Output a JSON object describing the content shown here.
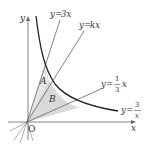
{
  "diagram": {
    "type": "function-graph",
    "axes": {
      "x_label": "x",
      "y_label": "y",
      "origin_label": "O"
    },
    "curves": [
      {
        "id": "line-3x",
        "label_lhs": "y",
        "label_eq": "=",
        "label_rhs": "3x",
        "equation": "y=3x"
      },
      {
        "id": "line-kx",
        "label_lhs": "y",
        "label_eq": "=",
        "label_rhs": "kx",
        "equation": "y=kx"
      },
      {
        "id": "line-third",
        "label_lhs": "y",
        "label_eq": "=",
        "frac_num": "1",
        "frac_den": "3",
        "label_rhs": "x",
        "equation": "y=(1/3)x"
      },
      {
        "id": "hyperbola",
        "label_lhs": "y",
        "label_eq": "=",
        "frac_num": "3",
        "frac_den": "x",
        "equation": "y=3/x"
      }
    ],
    "regions": [
      {
        "id": "A",
        "label": "A",
        "bounded_by": [
          "y=3x",
          "y=kx",
          "y=3/x"
        ]
      },
      {
        "id": "B",
        "label": "B",
        "bounded_by": [
          "y=kx",
          "y=(1/3)x",
          "y=3/x"
        ]
      }
    ],
    "colors": {
      "line": "#555555",
      "curve": "#222222",
      "shade": "#d9d9d9",
      "text": "#333333"
    }
  }
}
